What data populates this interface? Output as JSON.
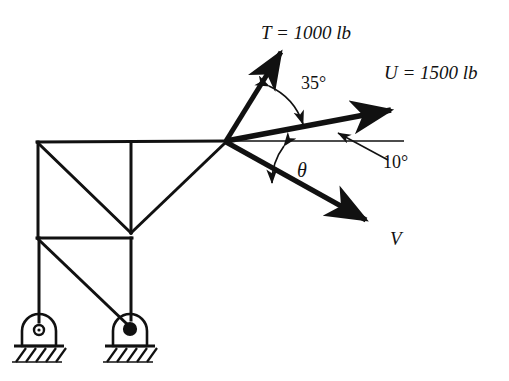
{
  "figure": {
    "type": "statics-free-body-diagram",
    "background_color": "#ffffff",
    "line_color": "#111111"
  },
  "labels": {
    "force_T": "T = 1000 lb",
    "force_U": "U = 1500 lb",
    "force_V": "V",
    "angle_35": "35°",
    "angle_10": "10°",
    "angle_theta": "θ"
  },
  "vectors": [
    {
      "name": "T",
      "label": "T = 1000 lb",
      "magnitude": 1000,
      "unit": "lb",
      "angle_from_horizontal_deg": 55,
      "direction": "up-right"
    },
    {
      "name": "U",
      "label": "U = 1500 lb",
      "magnitude": 1500,
      "unit": "lb",
      "angle_from_horizontal_deg": 10,
      "direction": "right-up"
    },
    {
      "name": "V",
      "label": "V",
      "magnitude": null,
      "unit": "lb",
      "angle_from_horizontal_deg": -29,
      "direction": "down-right"
    }
  ],
  "angles": [
    {
      "name": "35deg",
      "label": "35°",
      "value": 35,
      "between": [
        "T",
        "U"
      ]
    },
    {
      "name": "10deg",
      "label": "10°",
      "value": 10,
      "between": [
        "U",
        "horizontal-reference"
      ]
    },
    {
      "name": "theta",
      "label": "θ",
      "value": null,
      "between": [
        "horizontal-reference",
        "V"
      ]
    }
  ],
  "supports": [
    {
      "name": "left-support",
      "type": "pin",
      "pin_fill": "hollow"
    },
    {
      "name": "right-support",
      "type": "pin",
      "pin_fill": "solid"
    }
  ]
}
